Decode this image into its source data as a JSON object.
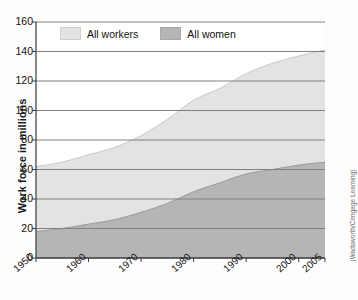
{
  "chart_data": {
    "type": "area",
    "title": "",
    "subtitle": "",
    "xlabel": "",
    "ylabel": "Work force in millions",
    "ylim": [
      0,
      160
    ],
    "xlim": [
      1950,
      2005
    ],
    "grid": true,
    "legend_position": "top-left-inside",
    "y_ticks": [
      0,
      20,
      40,
      60,
      80,
      100,
      120,
      140,
      160
    ],
    "x_ticks": [
      1950,
      1960,
      1970,
      1980,
      1990,
      2000,
      2005
    ],
    "x_tick_labels": [
      "1950",
      "1960",
      "1970",
      "1980",
      "1990",
      "2000",
      "2005"
    ],
    "y_tick_labels": [
      "0",
      "20",
      "40",
      "60",
      "80",
      "100",
      "120",
      "140",
      "160"
    ],
    "annotation": "(Wadsworth/Cengage Learning)",
    "x": [
      1950,
      1955,
      1960,
      1965,
      1970,
      1975,
      1980,
      1985,
      1990,
      1995,
      2000,
      2005
    ],
    "series": [
      {
        "name": "All workers",
        "color": "#e3e3e3",
        "values": [
          62,
          65,
          70,
          75,
          83,
          94,
          107,
          115,
          125,
          132,
          137,
          141
        ]
      },
      {
        "name": "All women",
        "color": "#b5b5b5",
        "values": [
          18,
          20,
          23,
          26,
          31,
          37,
          45,
          51,
          57,
          60,
          63,
          65
        ]
      }
    ]
  },
  "legend": {
    "items": [
      {
        "label": "All workers",
        "color": "#e3e3e3"
      },
      {
        "label": "All women",
        "color": "#b5b5b5"
      }
    ]
  },
  "axes": {
    "y_title": "Work force in millions"
  },
  "credit": {
    "text": "(Wadsworth/Cengage Learning)"
  }
}
